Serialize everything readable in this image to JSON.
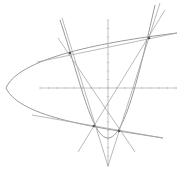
{
  "figure": {
    "colors": {
      "background": "#ffffff",
      "curve": "#9a9a9a",
      "line": "#a8a8a8",
      "axis": "#b4b4b4",
      "point": "#555555"
    },
    "axes": {
      "x_axis": {
        "x1": 40,
        "x2": 177,
        "y": 88,
        "tick_spacing": 8.5
      },
      "y_axis": {
        "x": 108,
        "y1": 20,
        "y2": 167,
        "tick_spacing": 8.5
      }
    },
    "curves": [
      {
        "name": "sideways-parabola",
        "path": "M 177 33 C 120 40, 20 55, 6 88 C 20 118, 100 128, 163 138"
      },
      {
        "name": "upward-parabola",
        "path": "M 60 20 C 80 80, 92 138, 108 138 C 124 138, 138 80, 155 5"
      }
    ],
    "lines": [
      {
        "name": "upper-tangent",
        "x1": 37,
        "y1": 62,
        "x2": 177,
        "y2": 33
      },
      {
        "name": "lower-tangent",
        "x1": 32,
        "y1": 115,
        "x2": 163,
        "y2": 138
      },
      {
        "name": "left-steep-tangent",
        "x1": 58,
        "y1": 38,
        "x2": 135,
        "y2": 152
      },
      {
        "name": "right-steep-tangent",
        "x1": 165,
        "y1": 10,
        "x2": 78,
        "y2": 152
      },
      {
        "name": "v-left-line",
        "x1": 62,
        "y1": 18,
        "x2": 108,
        "y2": 166
      },
      {
        "name": "v-right-line",
        "x1": 160,
        "y1": 3,
        "x2": 108,
        "y2": 166
      }
    ],
    "points": [
      {
        "name": "tangency-upper-left",
        "x": 70,
        "y": 53
      },
      {
        "name": "tangency-upper-right",
        "x": 149,
        "y": 38
      },
      {
        "name": "tangency-lower-left",
        "x": 94,
        "y": 126
      },
      {
        "name": "tangency-lower-right",
        "x": 119,
        "y": 131
      }
    ]
  }
}
